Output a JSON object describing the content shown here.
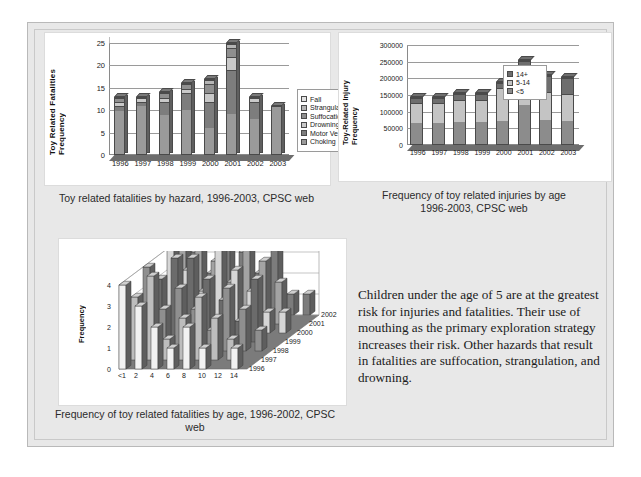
{
  "slide": {
    "background_color": "#e8e8e8",
    "panel_color": "#ffffff"
  },
  "chart1": {
    "caption": "Toy related fatalities by hazard, 1996-2003, CPSC web",
    "chart_data": {
      "type": "bar",
      "stacked": true,
      "title": "Toy related fatalities by hazard, 1996-2003, CPSC web",
      "xlabel": "",
      "ylabel": "Toy Related Fatalities Frequency",
      "ylim": [
        0,
        25
      ],
      "yticks": [
        0,
        5,
        10,
        15,
        20,
        25
      ],
      "grid": true,
      "legend_position": "right",
      "categories": [
        "1996",
        "1997",
        "1998",
        "1999",
        "2000",
        "2001",
        "2002",
        "2003"
      ],
      "series": [
        {
          "name": "Choking",
          "color": "#9a9a9a",
          "values": [
            10,
            11,
            9,
            10,
            6,
            9,
            8,
            11
          ]
        },
        {
          "name": "Motor Vehicle",
          "color": "#7d7d7d",
          "values": [
            1,
            1,
            3,
            4,
            6,
            10,
            4,
            0
          ]
        },
        {
          "name": "Drowning",
          "color": "#c9c9c9",
          "values": [
            1,
            1,
            1,
            1,
            2,
            3,
            1,
            0
          ]
        },
        {
          "name": "Suffocation",
          "color": "#8f8f8f",
          "values": [
            1,
            0,
            1,
            1,
            2,
            2,
            0,
            0
          ]
        },
        {
          "name": "Strangulation",
          "color": "#b5b5b5",
          "values": [
            0,
            0,
            0,
            0,
            1,
            1,
            0,
            0
          ]
        },
        {
          "name": "Fall",
          "color": "#e3e3e3",
          "values": [
            0,
            0,
            0,
            0,
            0,
            0,
            0,
            0
          ]
        }
      ],
      "totals": [
        13,
        13,
        14,
        16,
        17,
        25,
        13,
        11
      ]
    },
    "legend": [
      {
        "label": "Fall",
        "color": "#e3e3e3"
      },
      {
        "label": "Strangulation",
        "color": "#b5b5b5"
      },
      {
        "label": "Suffocation",
        "color": "#8f8f8f"
      },
      {
        "label": "Drowning",
        "color": "#c9c9c9"
      },
      {
        "label": "Motor Vehicle",
        "color": "#7d7d7d"
      },
      {
        "label": "Choking",
        "color": "#9a9a9a"
      }
    ]
  },
  "chart2": {
    "caption_line1": "Frequency of toy related injuries by age",
    "caption_line2": "1996-2003, CPSC web",
    "chart_data": {
      "type": "bar",
      "stacked": true,
      "title": "Frequency of toy related injuries by age 1996-2003, CPSC web",
      "xlabel": "",
      "ylabel": "Toy-Related Injury Frequency",
      "ylim": [
        0,
        300000
      ],
      "yticks": [
        0,
        50000,
        100000,
        150000,
        200000,
        250000,
        300000
      ],
      "ytick_labels": [
        "0",
        "50000",
        "100000",
        "150000",
        "200000",
        "250000",
        "300000"
      ],
      "grid": true,
      "legend_position": "inside-top-left",
      "categories": [
        "1996",
        "1997",
        "1998",
        "1999",
        "2000",
        "2001",
        "2002",
        "2003"
      ],
      "series": [
        {
          "name": "<5",
          "color": "#8c8c8c",
          "values": [
            65000,
            65000,
            68000,
            70000,
            70000,
            120000,
            75000,
            70000
          ]
        },
        {
          "name": "5-14",
          "color": "#c4c4c4",
          "values": [
            65000,
            65000,
            70000,
            68000,
            105000,
            80000,
            85000,
            85000
          ]
        },
        {
          "name": "14+",
          "color": "#6e6e6e",
          "values": [
            15000,
            15000,
            17000,
            17000,
            15000,
            55000,
            50000,
            50000
          ]
        }
      ],
      "totals": [
        145000,
        145000,
        155000,
        155000,
        190000,
        255000,
        210000,
        205000
      ]
    },
    "legend": [
      {
        "label": "14+",
        "color": "#6e6e6e"
      },
      {
        "label": "5-14",
        "color": "#c4c4c4"
      },
      {
        "label": "<5",
        "color": "#8c8c8c"
      }
    ]
  },
  "chart3": {
    "caption_line1": "Frequency of toy related fatalities by age, 1996-2002, CPSC",
    "caption_line2": "web",
    "chart_data": {
      "type": "bar",
      "three_d": true,
      "title": "Frequency of toy related fatalities by age, 1996-2002, CPSC web",
      "xlabel": "",
      "ylabel": "Frequency",
      "zlabel": "",
      "ylim": [
        0,
        4
      ],
      "yticks": [
        0,
        1,
        2,
        3,
        4
      ],
      "grid": true,
      "x_categories": [
        "<1",
        "2",
        "4",
        "6",
        "8",
        "10",
        "12",
        "14"
      ],
      "z_categories": [
        "1996",
        "1997",
        "1998",
        "1999",
        "2000",
        "2001",
        "2002"
      ],
      "series": [
        {
          "name": "1996",
          "values": [
            4,
            3,
            2,
            1,
            2,
            1,
            0,
            1
          ]
        },
        {
          "name": "1997",
          "values": [
            3,
            4,
            1,
            2,
            3,
            2,
            1,
            0
          ]
        },
        {
          "name": "1998",
          "values": [
            4,
            2,
            3,
            2,
            1,
            3,
            2,
            1
          ]
        },
        {
          "name": "1999",
          "values": [
            3,
            4,
            4,
            3,
            2,
            1,
            3,
            0
          ]
        },
        {
          "name": "2000",
          "values": [
            4,
            3,
            2,
            4,
            3,
            2,
            1,
            1
          ]
        },
        {
          "name": "2001",
          "values": [
            4,
            4,
            3,
            2,
            4,
            3,
            2,
            0
          ]
        },
        {
          "name": "2002",
          "values": [
            3,
            2,
            4,
            3,
            2,
            4,
            1,
            1
          ]
        }
      ]
    }
  },
  "body_text": {
    "paragraph": "Children under the age of 5 are at the greatest risk for injuries and fatalities. Their use of mouthing as the primary exploration strategy increases their risk. Other hazards that result in fatalities are suffocation, strangulation, and drowning."
  }
}
